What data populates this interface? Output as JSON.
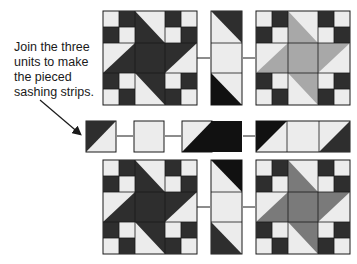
{
  "caption": {
    "text": "Join the three units to make the pieced sashing strips."
  },
  "colors": {
    "dark": "#2e2e2e",
    "black": "#111111",
    "light": "#ececec",
    "medium_gray": "#a8a8a8",
    "darker_gray": "#7a7a7a",
    "outline": "#1a1a1a"
  },
  "blocks": [
    {
      "position": "top-left",
      "star_color": "dark"
    },
    {
      "position": "top-right",
      "star_color": "medium_gray"
    },
    {
      "position": "bottom-left",
      "star_color": "dark"
    },
    {
      "position": "bottom-right",
      "star_color": "darker_gray"
    }
  ],
  "sashing": {
    "vertical_strips": [
      "top-center",
      "bottom-center"
    ],
    "horizontal_strips": [
      "middle-left",
      "middle-right"
    ],
    "cornerstone": "center-black-square"
  }
}
